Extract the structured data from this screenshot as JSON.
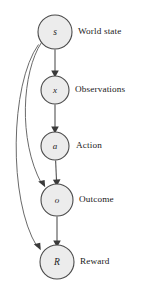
{
  "diagram": {
    "type": "directed-graph",
    "colors": {
      "node_fill": "#ececec",
      "node_stroke": "#4a4a4a",
      "edge": "#5a5a5a",
      "curved_edge": "#6a6a6a",
      "arrow": "#3a3a3a",
      "text": "#1a1a1a",
      "background": "#ffffff"
    },
    "nodes": [
      {
        "id": "s",
        "letter": "s",
        "label": "World state",
        "cx": 55,
        "cy": 32,
        "r": 17,
        "letter_size": 9.5,
        "label_x": 78,
        "label_y": 27
      },
      {
        "id": "x",
        "letter": "x",
        "label": "Observations",
        "cx": 55,
        "cy": 90,
        "r": 14,
        "letter_size": 9,
        "label_x": 75,
        "label_y": 85
      },
      {
        "id": "a",
        "letter": "a",
        "label": "Action",
        "cx": 55,
        "cy": 146,
        "r": 14,
        "letter_size": 9,
        "label_x": 76,
        "label_y": 141
      },
      {
        "id": "o",
        "letter": "o",
        "label": "Outcome",
        "cx": 57,
        "cy": 200,
        "r": 16,
        "letter_size": 9,
        "label_x": 79,
        "label_y": 195
      },
      {
        "id": "R",
        "letter": "R",
        "label": "Reward",
        "cx": 57,
        "cy": 262,
        "r": 17,
        "letter_size": 9.5,
        "label_x": 80,
        "label_y": 257
      }
    ],
    "edges": [
      {
        "id": "s-to-x",
        "from": "s",
        "to": "x",
        "style": "straight"
      },
      {
        "id": "x-to-a",
        "from": "x",
        "to": "a",
        "style": "straight"
      },
      {
        "id": "a-to-o",
        "from": "a",
        "to": "o",
        "style": "straight"
      },
      {
        "id": "o-to-R",
        "from": "o",
        "to": "R",
        "style": "straight"
      },
      {
        "id": "s-to-o",
        "from": "s",
        "to": "o",
        "style": "curved-left"
      },
      {
        "id": "s-to-R",
        "from": "s",
        "to": "R",
        "style": "curved-left"
      }
    ],
    "paths": {
      "s_to_x": "M 55 49.5 L 55 73",
      "x_to_a": "M 55 104.5 L 55 129",
      "a_to_o": "M 55.6 160.5 L 56.6 182",
      "o_to_R": "M 57 216.5 L 57 243",
      "s_to_o": "M 41.5 42.5 C 22 72 18 140 41.5 183.5",
      "s_to_R": "M 38.5 44.5 C 10 84 8 200 37 246.5"
    },
    "arrowheads": [
      {
        "id": "arrow-s-x",
        "points": "55,77.5 51.2,70.5 58.8,70.5"
      },
      {
        "id": "arrow-x-a",
        "points": "55,133.5 51.2,126.5 58.8,126.5"
      },
      {
        "id": "arrow-a-o",
        "points": "56.8,186.5 52.9,179.7 60.5,179.2"
      },
      {
        "id": "arrow-o-R",
        "points": "57,247.5 53.2,240.5 60.8,240.5"
      },
      {
        "id": "arrow-s-o",
        "points": "45.2,187.2 38.2,181.6 44.6,180.0"
      },
      {
        "id": "arrow-s-R",
        "points": "40.8,250.2 33.8,244.3 40.2,242.8"
      }
    ]
  }
}
